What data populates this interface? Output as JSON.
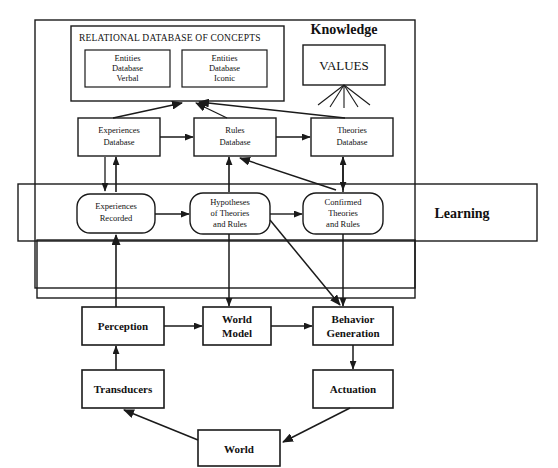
{
  "diagram": {
    "title_knowledge": "Knowledge",
    "title_learning": "Learning",
    "relational_db": {
      "header": "RELATIONAL DATABASE OF CONCEPTS",
      "entities_verbal": [
        "Entities",
        "Database",
        "Verbal"
      ],
      "entities_iconic": [
        "Entities",
        "Database",
        "Iconic"
      ]
    },
    "values_box": "VALUES",
    "databases": {
      "experiences": [
        "Experiences",
        "Database"
      ],
      "rules": [
        "Rules",
        "Database"
      ],
      "theories": [
        "Theories",
        "Database"
      ]
    },
    "learning_nodes": {
      "experiences_recorded": [
        "Experiences",
        "Recorded"
      ],
      "hypotheses": [
        "Hypotheses",
        "of Theories",
        "and Rules"
      ],
      "confirmed": [
        "Confirmed",
        "Theories",
        "and Rules"
      ]
    },
    "pipeline": {
      "perception": "Perception",
      "world_model": [
        "World",
        "Model"
      ],
      "behavior_generation": [
        "Behavior",
        "Generation"
      ],
      "transducers": "Transducers",
      "actuation": "Actuation",
      "world": "World"
    },
    "colors": {
      "stroke": "#1a1a1a",
      "text": "#111111",
      "background": "#ffffff"
    }
  }
}
